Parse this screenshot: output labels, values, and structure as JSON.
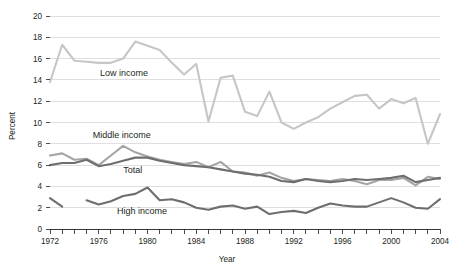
{
  "chart_data": {
    "type": "line",
    "title": "",
    "xlabel": "Year",
    "ylabel": "Percent",
    "xlim": [
      1972,
      2004
    ],
    "ylim": [
      0,
      20
    ],
    "grid": true,
    "legend": "inline-labels",
    "ytick_labels": [
      "0",
      "2",
      "4",
      "6",
      "8",
      "10",
      "12",
      "14",
      "16",
      "18",
      "20"
    ],
    "ytick_values": [
      0,
      2,
      4,
      6,
      8,
      10,
      12,
      14,
      16,
      18,
      20
    ],
    "xtick_labels": [
      "1972",
      "1976",
      "1980",
      "1984",
      "1988",
      "1992",
      "1996",
      "2000",
      "2004"
    ],
    "xtick_values": [
      1972,
      1976,
      1980,
      1984,
      1988,
      1992,
      1996,
      2000,
      2004
    ],
    "x": [
      1972,
      1973,
      1974,
      1975,
      1976,
      1977,
      1978,
      1979,
      1980,
      1981,
      1982,
      1983,
      1984,
      1985,
      1986,
      1987,
      1988,
      1989,
      1990,
      1991,
      1992,
      1993,
      1994,
      1995,
      1996,
      1997,
      1998,
      1999,
      2000,
      2001,
      2002,
      2003,
      2004
    ],
    "series": [
      {
        "name": "Low income",
        "color": "#c6c6c6",
        "label_x": 1976.1,
        "label_y": 14.35,
        "values": [
          13.8,
          17.3,
          15.8,
          15.7,
          15.6,
          15.6,
          16.0,
          17.6,
          17.2,
          16.8,
          15.6,
          14.5,
          15.5,
          10.1,
          14.2,
          14.4,
          11.0,
          10.6,
          12.9,
          10.0,
          9.4,
          10.0,
          10.5,
          11.3,
          11.9,
          12.5,
          12.6,
          11.3,
          12.2,
          11.8,
          12.3,
          8.0,
          10.8
        ]
      },
      {
        "name": "Middle income",
        "color": "#a5a5a5",
        "label_x": 1975.5,
        "label_y": 8.5,
        "values": [
          6.9,
          7.1,
          6.5,
          6.6,
          6.0,
          6.9,
          7.8,
          7.2,
          6.8,
          6.5,
          6.3,
          6.1,
          6.3,
          5.8,
          6.3,
          5.4,
          5.3,
          5.0,
          5.3,
          4.8,
          4.5,
          4.7,
          4.6,
          4.5,
          4.7,
          4.5,
          4.2,
          4.6,
          4.6,
          4.8,
          4.1,
          4.9,
          4.7
        ]
      },
      {
        "name": "Total",
        "color": "#6e6e6e",
        "label_x": 1978.0,
        "label_y": 5.3,
        "values": [
          6.0,
          6.2,
          6.2,
          6.5,
          5.9,
          6.1,
          6.4,
          6.7,
          6.7,
          6.4,
          6.2,
          6.0,
          5.9,
          5.8,
          5.6,
          5.4,
          5.2,
          5.1,
          4.9,
          4.5,
          4.4,
          4.7,
          4.5,
          4.4,
          4.5,
          4.7,
          4.6,
          4.7,
          4.8,
          5.0,
          4.4,
          4.6,
          4.8
        ]
      },
      {
        "name": "High income",
        "color": "#6e6e6e",
        "label_x": 1977.5,
        "label_y": 1.45,
        "values": [
          2.9,
          2.1,
          null,
          2.7,
          2.3,
          2.6,
          3.1,
          3.3,
          3.9,
          2.7,
          2.8,
          2.5,
          2.0,
          1.8,
          2.1,
          2.2,
          1.9,
          2.1,
          1.4,
          1.6,
          1.7,
          1.5,
          2.0,
          2.4,
          2.2,
          2.1,
          2.1,
          2.5,
          2.9,
          2.5,
          2.0,
          1.9,
          2.8
        ]
      }
    ]
  }
}
